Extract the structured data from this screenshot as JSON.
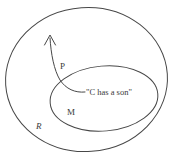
{
  "figure": {
    "type": "set-diagram",
    "background_color": "#ffffff",
    "stroke_color": "#444444",
    "text_color": "#3a3a3a",
    "sets": [
      {
        "id": "outer",
        "label": "R",
        "label_style": "italic",
        "shape": "ellipse",
        "label_x": 36,
        "label_y": 122
      },
      {
        "id": "inner",
        "label": "M",
        "label_style": "normal",
        "shape": "ellipse",
        "label_x": 67,
        "label_y": 108
      }
    ],
    "points": [
      {
        "id": "p-point",
        "label": "P",
        "label_x": 60,
        "label_y": 62
      }
    ],
    "annotations": [
      {
        "id": "proposition",
        "text": "\"C has a son\"",
        "x": 86,
        "y": 88
      }
    ],
    "arrow": {
      "id": "upward-arrow",
      "direction": "up",
      "tip_x": 50,
      "tip_y": 35
    }
  }
}
